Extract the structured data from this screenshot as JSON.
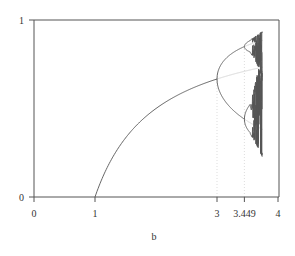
{
  "chart_data": {
    "type": "line",
    "title": "",
    "xlabel": "b",
    "ylabel": "",
    "xlim": [
      0,
      4
    ],
    "ylim": [
      0,
      1
    ],
    "grid": false,
    "legend": "none",
    "x_ticks": [
      {
        "value": 0,
        "label": "0"
      },
      {
        "value": 1,
        "label": "1"
      },
      {
        "value": 3,
        "label": "3"
      },
      {
        "value": 3.449,
        "label": "3.449"
      },
      {
        "value": 4,
        "label": "4"
      }
    ],
    "y_ticks": [
      {
        "value": 0,
        "label": "0"
      },
      {
        "value": 1,
        "label": "1"
      }
    ],
    "reference_lines": [
      {
        "orientation": "vertical",
        "x": 3,
        "style": "dotted",
        "y_range": [
          0,
          0.6667
        ]
      },
      {
        "orientation": "vertical",
        "x": 3.449,
        "style": "dotted",
        "y_range": [
          0,
          0.8499
        ]
      }
    ],
    "series": [
      {
        "name": "stable fixed point x* = 1 - 1/b",
        "style": "solid",
        "b_range": [
          1,
          3
        ],
        "formula": "fixed"
      },
      {
        "name": "unstable fixed point",
        "style": "faint",
        "b_range": [
          3,
          3.75
        ],
        "formula": "fixed"
      },
      {
        "name": "stable period-2 cycle",
        "style": "solid",
        "b_range": [
          3,
          3.449
        ],
        "formula": "period2"
      },
      {
        "name": "unstable period-2 cycle",
        "style": "faint",
        "b_range": [
          3.449,
          3.75
        ],
        "formula": "period2"
      },
      {
        "name": "stable period-4 cycle",
        "style": "solid",
        "b_range": [
          3.449,
          3.74
        ],
        "formula": "period4"
      }
    ],
    "colors": {
      "axis": "#555555",
      "curve": "#555555",
      "faint": "#d8d8d8",
      "dotted": "#dddddd"
    }
  }
}
